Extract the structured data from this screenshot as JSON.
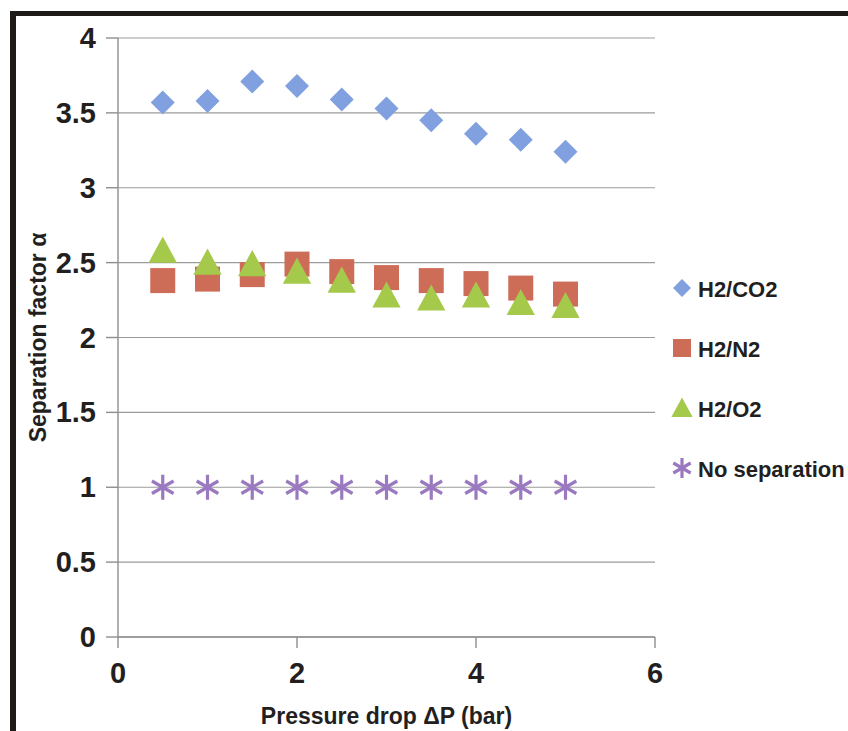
{
  "chart_data": {
    "type": "scatter",
    "title": "",
    "xlabel": "Pressure drop ΔP (bar)",
    "ylabel": "Separation factor α",
    "xlim": [
      0,
      6
    ],
    "ylim": [
      0,
      4
    ],
    "xticks": [
      "0",
      "2",
      "4",
      "6"
    ],
    "xtick_values": [
      0,
      2,
      4,
      6
    ],
    "yticks": [
      "0",
      "0.5",
      "1",
      "1.5",
      "2",
      "2.5",
      "3",
      "3.5",
      "4"
    ],
    "ytick_values": [
      0,
      0.5,
      1,
      1.5,
      2,
      2.5,
      3,
      3.5,
      4
    ],
    "grid": "horizontal",
    "legend_position": "right",
    "x": [
      0.5,
      1.0,
      1.5,
      2.0,
      2.5,
      3.0,
      3.5,
      4.0,
      4.5,
      5.0
    ],
    "series": [
      {
        "name": "H2/CO2",
        "marker": "diamond",
        "color": "#80a0e0",
        "values": [
          3.57,
          3.58,
          3.71,
          3.68,
          3.59,
          3.53,
          3.45,
          3.36,
          3.32,
          3.24
        ]
      },
      {
        "name": "H2/N2",
        "marker": "square",
        "color": "#ce6d57",
        "values": [
          2.38,
          2.39,
          2.42,
          2.49,
          2.44,
          2.4,
          2.38,
          2.36,
          2.33,
          2.29
        ]
      },
      {
        "name": "H2/O2",
        "marker": "triangle",
        "color": "#a5c94a",
        "values": [
          2.58,
          2.5,
          2.49,
          2.44,
          2.38,
          2.28,
          2.26,
          2.28,
          2.23,
          2.21
        ]
      },
      {
        "name": "No separation",
        "marker": "asterisk",
        "color": "#9a79c0",
        "values": [
          1.0,
          1.0,
          1.0,
          1.0,
          1.0,
          1.0,
          1.0,
          1.0,
          1.0,
          1.0
        ]
      }
    ]
  },
  "legend": {
    "items": [
      {
        "label": "H2/CO2",
        "marker": "diamond-marker-icon",
        "color": "#80a0e0"
      },
      {
        "label": "H2/N2",
        "marker": "square-marker-icon",
        "color": "#ce6d57"
      },
      {
        "label": "H2/O2",
        "marker": "triangle-marker-icon",
        "color": "#a5c94a"
      },
      {
        "label": "No separation",
        "marker": "asterisk-marker-icon",
        "color": "#9a79c0"
      }
    ]
  },
  "axes": {
    "x_title": "Pressure drop ΔP (bar)",
    "y_title": "Separation factor α",
    "x_tick_labels": [
      "0",
      "2",
      "4",
      "6"
    ],
    "y_tick_labels": [
      "0",
      "0.5",
      "1",
      "1.5",
      "2",
      "2.5",
      "3",
      "3.5",
      "4"
    ]
  }
}
